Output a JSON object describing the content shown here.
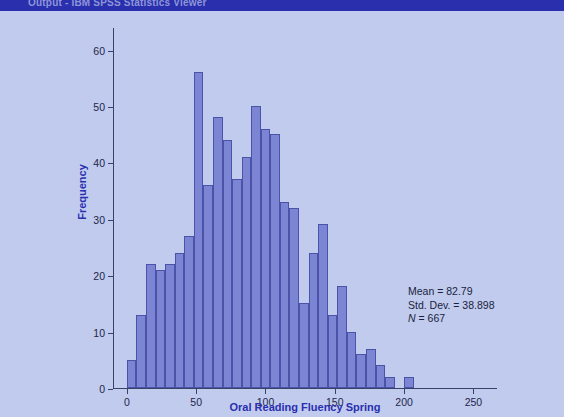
{
  "window": {
    "banner_title": "Output - IBM SPSS Statistics Viewer",
    "banner_color": "#2a2fae",
    "background_color": "#c0cbee"
  },
  "chart_data": {
    "type": "bar",
    "subtype": "histogram",
    "title": "",
    "xlabel": "Oral Reading Fluency Spring",
    "ylabel": "Frequency",
    "xlim": [
      -10,
      267
    ],
    "ylim": [
      0,
      64
    ],
    "xticks": [
      0,
      50,
      100,
      150,
      200,
      250
    ],
    "xtick_labels": [
      "0",
      "50",
      "100",
      "150",
      "200",
      "250"
    ],
    "yticks": [
      0,
      10,
      20,
      30,
      40,
      50,
      60
    ],
    "ytick_labels": [
      "0",
      "10",
      "20",
      "30",
      "40",
      "50",
      "60"
    ],
    "grid": false,
    "legend": null,
    "bar_fill_color": "#7b85d4",
    "bar_edge_color": "#4a53a8",
    "axis_color": "#3a4168",
    "label_color": "#2a2fae",
    "bin_width": 6.9,
    "bin_starts": [
      0.0,
      6.9,
      13.8,
      20.7,
      27.6,
      34.5,
      41.4,
      48.3,
      55.2,
      62.1,
      69.0,
      75.9,
      82.8,
      89.7,
      96.6,
      103.5,
      110.4,
      117.3,
      124.2,
      131.1,
      138.0,
      144.9,
      151.8,
      158.7,
      165.6,
      172.5,
      179.4,
      186.3,
      200.1
    ],
    "values": [
      5,
      13,
      22,
      21,
      22,
      24,
      27,
      56,
      36,
      48,
      44,
      37,
      41,
      50,
      46,
      45,
      33,
      32,
      15,
      24,
      29,
      13,
      18,
      10,
      6,
      7,
      4,
      2,
      2
    ],
    "annotations": {
      "mean_label": "Mean = 82.79",
      "std_dev_label": "Std. Dev. = 38.898",
      "n_prefix": "N",
      "n_value": " = 667"
    },
    "stats": {
      "mean": 82.79,
      "std_dev": 38.898,
      "n": 667
    }
  }
}
